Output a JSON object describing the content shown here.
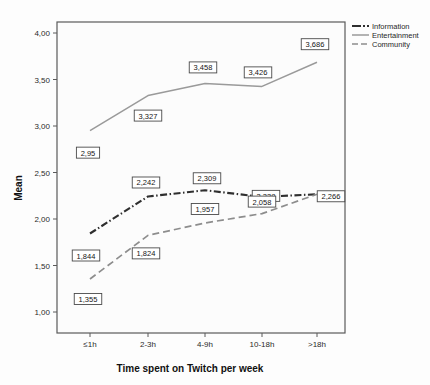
{
  "chart_data": {
    "type": "line",
    "title": "",
    "xlabel": "Time spent on Twitch per week",
    "ylabel": "Mean",
    "categories": [
      "≤1h",
      "2-3h",
      "4-9h",
      "10-18h",
      ">18h"
    ],
    "ylim": [
      1.0,
      4.1
    ],
    "yticks": [
      "1,00",
      "1,50",
      "2,00",
      "2,50",
      "3,00",
      "3,50",
      "4,00"
    ],
    "ytick_values": [
      1.0,
      1.5,
      2.0,
      2.5,
      3.0,
      3.5,
      4.0
    ],
    "grid": false,
    "legend_position": "top-right",
    "decimal_separator": ",",
    "series": [
      {
        "name": "Information",
        "color": "#2f2f2f",
        "style": "dash-dot",
        "values": [
          1.844,
          2.242,
          2.309,
          2.238,
          2.266
        ],
        "labels": [
          "1,844",
          "2,242",
          "2,309",
          "2,238",
          "2,266"
        ]
      },
      {
        "name": "Entertainment",
        "color": "#9a9a9a",
        "style": "solid",
        "values": [
          2.95,
          3.327,
          3.458,
          3.426,
          3.686
        ],
        "labels": [
          "2,95",
          "3,327",
          "3,458",
          "3,426",
          "3,686"
        ]
      },
      {
        "name": "Community",
        "color": "#8d8d8d",
        "style": "dashed",
        "values": [
          1.355,
          1.824,
          1.957,
          2.058,
          2.266
        ],
        "labels": [
          "1,355",
          "1,824",
          "1,957",
          "2,058",
          "2,266"
        ]
      }
    ]
  },
  "legend": {
    "items": [
      {
        "label": "Information"
      },
      {
        "label": "Entertainment"
      },
      {
        "label": "Community"
      }
    ]
  },
  "axes": {
    "y_title": "Mean",
    "x_title": "Time spent on Twitch per week",
    "y_ticks": [
      "4,00",
      "3,50",
      "3,00",
      "2,50",
      "2,00",
      "1,50",
      "1,00"
    ],
    "x_ticks": [
      "≤1h",
      "2-3h",
      "4-9h",
      "10-18h",
      ">18h"
    ]
  },
  "data_labels": {
    "entertainment": [
      "2,95",
      "3,327",
      "3,458",
      "3,426",
      "3,686"
    ],
    "information": [
      "1,844",
      "2,242",
      "2,309",
      "2,238",
      "2,266"
    ],
    "community": [
      "1,355",
      "1,824",
      "1,957",
      "2,058",
      "2,266"
    ]
  }
}
